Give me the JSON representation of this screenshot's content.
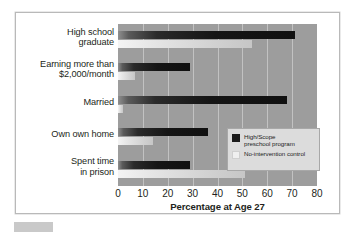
{
  "chart_data": {
    "type": "bar",
    "orientation": "horizontal",
    "title": "",
    "xlabel": "Percentage at Age 27",
    "ylabel": "",
    "xlim": [
      0,
      80
    ],
    "xticks": [
      0,
      10,
      20,
      30,
      40,
      50,
      60,
      70,
      80
    ],
    "grid": true,
    "legend_position": "center-right",
    "categories": [
      "High school graduate",
      "Earning more than $2,000/month",
      "Married",
      "Own own home",
      "Spent time in prison"
    ],
    "category_lines": [
      [
        "High school",
        "graduate"
      ],
      [
        "Earning more than",
        "$2,000/month"
      ],
      [
        "Married"
      ],
      [
        "Own own home"
      ],
      [
        "Spent time",
        "in prison"
      ]
    ],
    "series": [
      {
        "name": "High/Scope preschool program",
        "color": "#1b1b1b",
        "values": [
          71,
          29,
          68,
          36,
          29
        ]
      },
      {
        "name": "No-intervention control",
        "color": "#efefef",
        "values": [
          54,
          7,
          2,
          14,
          51
        ]
      }
    ]
  },
  "legend": {
    "entries": [
      {
        "label_lines": [
          "High/Scope",
          "preschool program"
        ],
        "swatch": "dark"
      },
      {
        "label_lines": [
          "No-intervention control"
        ],
        "swatch": "light"
      }
    ]
  },
  "axis": {
    "x_title": "Percentage at Age 27"
  },
  "colors": {
    "plot_background": "#9d9d9d",
    "gridline": "#c2c2c2",
    "frame_border": "#b9b9b9",
    "page_background": "#ffffff",
    "text": "#231f20",
    "legend_background": "#dcdcdc"
  }
}
